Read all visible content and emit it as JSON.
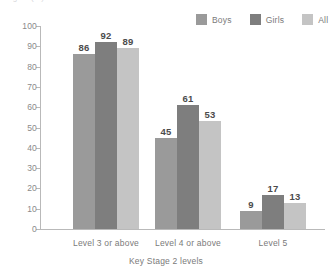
{
  "title_remnant": "ngths (%)",
  "legend": {
    "position": "top-right",
    "items": [
      {
        "label": "Boys",
        "color": "#9a9a9a"
      },
      {
        "label": "Girls",
        "color": "#7e7e7e"
      },
      {
        "label": "All",
        "color": "#c4c4c4"
      }
    ]
  },
  "chart_data": {
    "type": "bar",
    "title": "",
    "xlabel": "Key Stage 2 levels",
    "ylabel": "",
    "categories": [
      "Level 3 or above",
      "Level 4 or above",
      "Level 5"
    ],
    "series": [
      {
        "name": "Boys",
        "color": "#9a9a9a",
        "values": [
          86,
          45,
          9
        ]
      },
      {
        "name": "Girls",
        "color": "#7e7e7e",
        "values": [
          92,
          61,
          17
        ]
      },
      {
        "name": "All",
        "color": "#c4c4c4",
        "values": [
          89,
          53,
          13
        ]
      }
    ],
    "ylim": [
      0,
      100
    ],
    "yticks": [
      0,
      10,
      20,
      30,
      40,
      50,
      60,
      70,
      80,
      90,
      100
    ],
    "ytick_labels": [
      "0",
      "10",
      "20",
      "30",
      "40",
      "50",
      "60",
      "70",
      "80",
      "90",
      "100"
    ],
    "grid": false,
    "data_labels": true,
    "legend_position": "top-right"
  },
  "axis": {
    "line_color": "#b9b9b9",
    "tick_label_color": "#8a8a8a"
  }
}
